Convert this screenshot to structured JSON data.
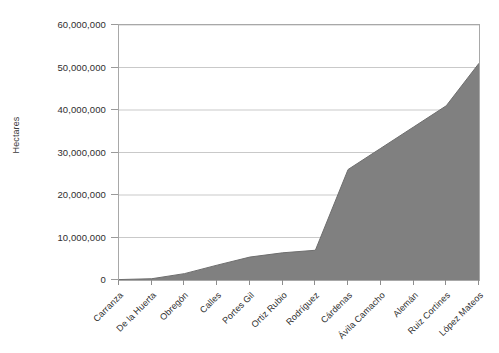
{
  "chart_data": {
    "type": "area",
    "title": "",
    "xlabel": "",
    "ylabel": "Hectares",
    "ylim": [
      0,
      60000000
    ],
    "ytick_step": 10000000,
    "grid": true,
    "legend": false,
    "legend_position": "none",
    "fill_color": "#808080",
    "line_color": "#6e6e6e",
    "grid_color": "#c9c9c9",
    "axis_color": "#a8a8a8",
    "categories": [
      "Carranza",
      "De la Huerta",
      "Obregón",
      "Calles",
      "Portes Gil",
      "Ortiz Rubio",
      "Rodríguez",
      "Cárdenas",
      "Ávila Camacho",
      "Alemán",
      "Ruiz Cortines",
      "López Mateos"
    ],
    "values": [
      100000,
      300000,
      1500000,
      3500000,
      5400000,
      6400000,
      7000000,
      26000000,
      31000000,
      36000000,
      41000000,
      51000000
    ],
    "ytick_labels": [
      "0",
      "10,000,000",
      "20,000,000",
      "30,000,000",
      "40,000,000",
      "50,000,000",
      "60,000,000"
    ],
    "ytick_values": [
      0,
      10000000,
      20000000,
      30000000,
      40000000,
      50000000,
      60000000
    ]
  }
}
